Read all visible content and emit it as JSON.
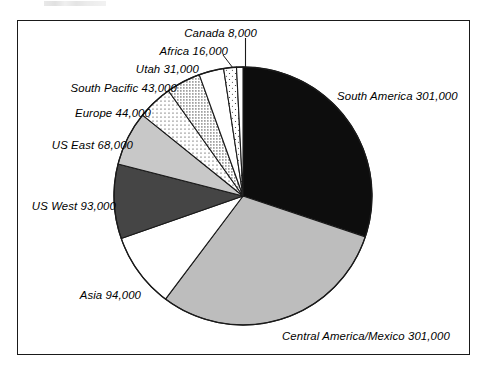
{
  "figure": {
    "background_color": "#ffffff",
    "frame_color": "#1a1a1a"
  },
  "chart_data": {
    "type": "pie",
    "title": "",
    "subtitle": "",
    "xlabel": "",
    "ylabel": "",
    "legend_position": "none",
    "grid": false,
    "total": 1000000,
    "start_angle_deg": 0,
    "direction": "clockwise",
    "categories": [
      "South America",
      "Central America/Mexico",
      "Asia",
      "US West",
      "US East",
      "Europe",
      "South Pacific",
      "Utah",
      "Africa",
      "Canada"
    ],
    "values": [
      301000,
      301000,
      94000,
      93000,
      68000,
      44000,
      43000,
      31000,
      16000,
      8000
    ],
    "value_labels": [
      "301,000",
      "301,000",
      "94,000",
      "93,000",
      "68,000",
      "44,000",
      "43,000",
      "31,000",
      "16,000",
      "8,000"
    ],
    "slices": [
      {
        "name": "South America",
        "value": 301000,
        "value_label": "301,000",
        "label": "South America 301,000",
        "fill": "#0d0d0d",
        "pattern": "solid-black",
        "start_deg": 0,
        "end_deg": 108.36,
        "label_side": "right"
      },
      {
        "name": "Central America/Mexico",
        "value": 301000,
        "value_label": "301,000",
        "label": "Central America/Mexico 301,000",
        "fill": "#bdbdbd",
        "pattern": "solid-light-gray",
        "start_deg": 108.36,
        "end_deg": 216.72,
        "label_side": "right"
      },
      {
        "name": "Asia",
        "value": 94000,
        "value_label": "94,000",
        "label": "Asia 94,000",
        "fill": "#ffffff",
        "pattern": "solid-white",
        "start_deg": 216.72,
        "end_deg": 250.56,
        "label_side": "left"
      },
      {
        "name": "US West",
        "value": 93000,
        "value_label": "93,000",
        "label": "US West 93,000",
        "fill": "#454545",
        "pattern": "solid-dark-gray",
        "start_deg": 250.56,
        "end_deg": 284.04,
        "label_side": "left"
      },
      {
        "name": "US East",
        "value": 68000,
        "value_label": "68,000",
        "label": "US East 68,000",
        "fill": "#c8c8c8",
        "pattern": "solid-light-gray",
        "start_deg": 284.04,
        "end_deg": 308.52,
        "label_side": "left"
      },
      {
        "name": "Europe",
        "value": 44000,
        "value_label": "44,000",
        "label": "Europe 44,000",
        "fill": "#ffffff",
        "pattern": "fine-dots",
        "start_deg": 308.52,
        "end_deg": 324.36,
        "label_side": "left"
      },
      {
        "name": "South Pacific",
        "value": 43000,
        "value_label": "43,000",
        "label": "South Pacific 43,000",
        "fill": "#ffffff",
        "pattern": "dense-dots",
        "start_deg": 324.36,
        "end_deg": 339.84,
        "label_side": "left"
      },
      {
        "name": "Utah",
        "value": 31000,
        "value_label": "31,000",
        "label": "Utah 31,000",
        "fill": "#ffffff",
        "pattern": "solid-white",
        "start_deg": 339.84,
        "end_deg": 351.0,
        "label_side": "left"
      },
      {
        "name": "Africa",
        "value": 16000,
        "value_label": "16,000",
        "label": "Africa 16,000",
        "fill": "#ffffff",
        "pattern": "sparse-dots",
        "start_deg": 351.0,
        "end_deg": 356.76,
        "label_side": "left"
      },
      {
        "name": "Canada",
        "value": 8000,
        "value_label": "8,000",
        "label": "Canada 8,000",
        "fill": "#ffffff",
        "pattern": "solid-white",
        "start_deg": 356.76,
        "end_deg": 360.0,
        "label_side": "top",
        "has_leader_line": true
      }
    ]
  }
}
